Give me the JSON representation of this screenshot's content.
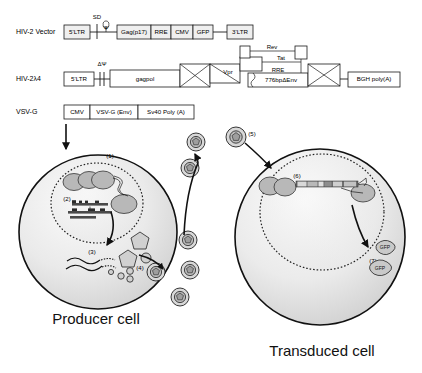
{
  "figure": {
    "background_color": "#ffffff"
  },
  "constructs": [
    {
      "id": "hiv2-vector",
      "row_label": "HIV-2 Vector",
      "annotations": [
        {
          "name": "sd-label",
          "text": "SD"
        },
        {
          "name": "psi-label",
          "text": "Ψ"
        }
      ],
      "elements": [
        {
          "name": "element-5ltr",
          "label": "5'LTR"
        },
        {
          "name": "element-gag-p17",
          "label": "Gag(p17)"
        },
        {
          "name": "element-rre",
          "label": "RRE"
        },
        {
          "name": "element-cmv",
          "label": "CMV"
        },
        {
          "name": "element-gfp",
          "label": "GFP"
        },
        {
          "name": "element-3ltr",
          "label": "3'LTR"
        }
      ]
    },
    {
      "id": "hiv2-lambda4",
      "row_label": "HIV-2λ4",
      "annotations": [
        {
          "name": "delta-psi-label",
          "text": "ΔΨ"
        },
        {
          "name": "rev-label",
          "text": "Rev"
        },
        {
          "name": "tat-label",
          "text": "Tat"
        },
        {
          "name": "rre-label",
          "text": "RRE"
        },
        {
          "name": "vpr-label",
          "text": "Vpr"
        }
      ],
      "elements": [
        {
          "name": "element-5ltr",
          "label": "5'LTR"
        },
        {
          "name": "element-gagpol",
          "label": "gagpol"
        },
        {
          "name": "element-delta-env",
          "label": "776bpΔEnv"
        },
        {
          "name": "element-bgh-polya",
          "label": "BGH poly(A)"
        }
      ]
    },
    {
      "id": "vsv-g",
      "row_label": "VSV-G",
      "annotations": [],
      "elements": [
        {
          "name": "element-cmv",
          "label": "CMV"
        },
        {
          "name": "element-vsvg-env",
          "label": "VSV-G (Env)"
        },
        {
          "name": "element-sv40-polya",
          "label": "Sv40 Poly (A)"
        }
      ]
    }
  ],
  "cells": [
    {
      "id": "producer-cell",
      "title": "Producer cell",
      "steps": [
        {
          "name": "step-1",
          "label": "(1)"
        },
        {
          "name": "step-2",
          "label": "(2)"
        },
        {
          "name": "step-3",
          "label": "(3)"
        },
        {
          "name": "step-4",
          "label": "(4)"
        }
      ]
    },
    {
      "id": "transduced-cell",
      "title": "Transduced cell",
      "steps": [
        {
          "name": "step-5",
          "label": "(5)"
        },
        {
          "name": "step-6",
          "label": "(6)"
        },
        {
          "name": "step-7",
          "label": "(7)"
        }
      ]
    }
  ],
  "gfp_products": [
    {
      "name": "gfp-protein-1",
      "label": "GFP"
    },
    {
      "name": "gfp-protein-2",
      "label": "GFP"
    }
  ],
  "colors": {
    "stroke": "#111111",
    "gene_box_fill": "#efefef",
    "cell_fill_light": "#f2f2f2",
    "cell_fill_mid": "#d9d9d9",
    "nucleus_fill": "#ececec",
    "chromosome_fill": "#b8b8b8",
    "virion_fill": "#d8d8d8"
  }
}
